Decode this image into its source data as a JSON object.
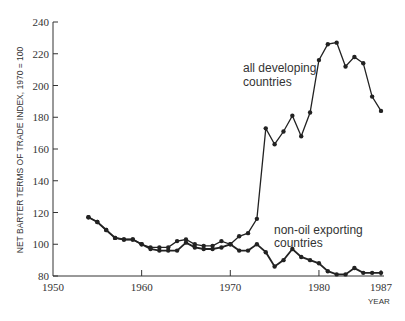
{
  "chart_data": {
    "type": "line",
    "title": "",
    "xlabel": "YEAR",
    "ylabel": "NET BARTER TERMS OF TRADE INDEX, 1970 = 100",
    "xlim": [
      1950,
      1987
    ],
    "ylim": [
      80,
      240
    ],
    "x_ticks": [
      "1950",
      "1960",
      "1970",
      "1980",
      "1987"
    ],
    "y_ticks": [
      "80",
      "100",
      "120",
      "140",
      "160",
      "180",
      "200",
      "220",
      "240"
    ],
    "grid": false,
    "legend": "inline annotations",
    "x": [
      1954,
      1955,
      1956,
      1957,
      1958,
      1959,
      1960,
      1961,
      1962,
      1963,
      1964,
      1965,
      1966,
      1967,
      1968,
      1969,
      1970,
      1971,
      1972,
      1973,
      1974,
      1975,
      1976,
      1977,
      1978,
      1979,
      1980,
      1981,
      1982,
      1983,
      1984,
      1985,
      1986,
      1987
    ],
    "series": [
      {
        "name": "all developing countries",
        "label_lines": [
          "all developing",
          "countries"
        ],
        "values": [
          117,
          114,
          109,
          104,
          103,
          103,
          100,
          98,
          98,
          98,
          102,
          103,
          100,
          99,
          99,
          102,
          100,
          105,
          107,
          116,
          173,
          163,
          171,
          181,
          168,
          183,
          216,
          226,
          227,
          212,
          218,
          214,
          193,
          184
        ]
      },
      {
        "name": "non-oil exporting countries",
        "label_lines": [
          "non-oil exporting",
          "countries"
        ],
        "values": [
          117,
          114,
          109,
          104,
          103,
          103,
          100,
          97,
          96,
          96,
          96,
          101,
          98,
          97,
          97,
          98,
          100,
          96,
          96,
          100,
          95,
          86,
          90,
          97,
          92,
          90,
          88,
          83,
          81,
          81,
          85,
          82,
          82,
          82
        ]
      }
    ]
  }
}
